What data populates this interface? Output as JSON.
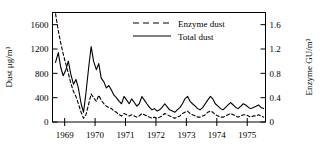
{
  "chart_data": {
    "type": "line",
    "title": "",
    "xlabel": "",
    "ylabel": "Dust μg/m³",
    "y2label": "Enzyme GU/m³",
    "xlim": [
      1968.6,
      1975.6
    ],
    "ylim": [
      0,
      1800
    ],
    "y2lim": [
      0,
      1.8
    ],
    "grid": false,
    "legend_position": "top-center",
    "xticks": [
      1969,
      1970,
      1971,
      1972,
      1973,
      1974,
      1975
    ],
    "xtick_labels": [
      "1969",
      "1970",
      "1971",
      "1972",
      "1973",
      "1974",
      "1975"
    ],
    "yticks": [
      0,
      400,
      800,
      1200,
      1600
    ],
    "ytick_labels": [
      "0",
      "400",
      "800",
      "1200",
      "1600"
    ],
    "y2ticks": [
      0,
      0.4,
      0.8,
      1.2,
      1.6
    ],
    "y2tick_labels": [
      "0",
      "0.4",
      "0.8",
      "1.2",
      "1.6"
    ],
    "series": [
      {
        "name": "Total dust",
        "style": "solid",
        "axis": "left",
        "color": "#000000",
        "x": [
          1968.7,
          1968.79,
          1968.87,
          1968.95,
          1969.04,
          1969.12,
          1969.2,
          1969.29,
          1969.37,
          1969.45,
          1969.54,
          1969.62,
          1969.7,
          1969.79,
          1969.87,
          1969.95,
          1970.04,
          1970.12,
          1970.2,
          1970.29,
          1970.37,
          1970.45,
          1970.54,
          1970.62,
          1970.7,
          1970.79,
          1970.87,
          1970.95,
          1971.04,
          1971.12,
          1971.2,
          1971.29,
          1971.37,
          1971.45,
          1971.54,
          1971.62,
          1971.7,
          1971.79,
          1971.87,
          1971.95,
          1972.04,
          1972.12,
          1972.2,
          1972.29,
          1972.37,
          1972.45,
          1972.54,
          1972.62,
          1972.7,
          1972.79,
          1972.87,
          1972.95,
          1973.04,
          1973.12,
          1973.2,
          1973.29,
          1973.37,
          1973.45,
          1973.54,
          1973.62,
          1973.7,
          1973.79,
          1973.87,
          1973.95,
          1974.04,
          1974.12,
          1974.2,
          1974.29,
          1974.37,
          1974.45,
          1974.54,
          1974.62,
          1974.7,
          1974.79,
          1974.87,
          1974.95,
          1975.04,
          1975.12,
          1975.2,
          1975.29,
          1975.37,
          1975.45,
          1975.54
        ],
        "y": [
          980,
          1140,
          900,
          760,
          860,
          1000,
          790,
          620,
          700,
          560,
          300,
          160,
          480,
          900,
          1240,
          1000,
          860,
          960,
          720,
          660,
          560,
          600,
          520,
          440,
          400,
          340,
          300,
          420,
          360,
          300,
          380,
          320,
          260,
          300,
          420,
          360,
          300,
          240,
          200,
          220,
          180,
          200,
          240,
          300,
          250,
          200,
          180,
          160,
          200,
          240,
          300,
          380,
          420,
          340,
          300,
          260,
          220,
          200,
          240,
          300,
          360,
          420,
          380,
          300,
          260,
          220,
          200,
          240,
          280,
          320,
          280,
          240,
          220,
          260,
          300,
          280,
          240,
          220,
          240,
          260,
          280,
          240,
          220
        ]
      },
      {
        "name": "Enzyme dust",
        "style": "dashed",
        "axis": "right",
        "color": "#000000",
        "x": [
          1968.7,
          1968.79,
          1968.87,
          1968.95,
          1969.04,
          1969.12,
          1969.2,
          1969.29,
          1969.37,
          1969.45,
          1969.54,
          1969.62,
          1969.7,
          1969.79,
          1969.87,
          1969.95,
          1970.04,
          1970.12,
          1970.2,
          1970.29,
          1970.37,
          1970.45,
          1970.54,
          1970.62,
          1970.7,
          1970.79,
          1970.87,
          1970.95,
          1971.04,
          1971.12,
          1971.2,
          1971.29,
          1971.37,
          1971.45,
          1971.54,
          1971.62,
          1971.7,
          1971.79,
          1971.87,
          1971.95,
          1972.04,
          1972.12,
          1972.2,
          1972.29,
          1972.37,
          1972.45,
          1972.54,
          1972.62,
          1972.7,
          1972.79,
          1972.87,
          1972.95,
          1973.04,
          1973.12,
          1973.2,
          1973.29,
          1973.37,
          1973.45,
          1973.54,
          1973.62,
          1973.7,
          1973.79,
          1973.87,
          1973.95,
          1974.04,
          1974.12,
          1974.2,
          1974.29,
          1974.37,
          1974.45,
          1974.54,
          1974.62,
          1974.7,
          1974.79,
          1974.87,
          1974.95,
          1975.04,
          1975.12,
          1975.2,
          1975.29,
          1975.37,
          1975.45,
          1975.54
        ],
        "y": [
          1.78,
          1.5,
          1.3,
          1.12,
          0.95,
          0.8,
          0.64,
          0.5,
          0.42,
          0.3,
          0.16,
          0.06,
          0.12,
          0.3,
          0.46,
          0.4,
          0.34,
          0.44,
          0.36,
          0.3,
          0.26,
          0.24,
          0.22,
          0.18,
          0.16,
          0.12,
          0.1,
          0.14,
          0.12,
          0.1,
          0.12,
          0.1,
          0.08,
          0.1,
          0.14,
          0.12,
          0.1,
          0.08,
          0.06,
          0.08,
          0.06,
          0.08,
          0.1,
          0.14,
          0.12,
          0.1,
          0.08,
          0.06,
          0.08,
          0.1,
          0.14,
          0.16,
          0.18,
          0.14,
          0.12,
          0.1,
          0.08,
          0.08,
          0.1,
          0.12,
          0.16,
          0.18,
          0.16,
          0.12,
          0.1,
          0.08,
          0.08,
          0.1,
          0.12,
          0.14,
          0.12,
          0.1,
          0.08,
          0.1,
          0.12,
          0.12,
          0.1,
          0.08,
          0.1,
          0.1,
          0.12,
          0.1,
          0.08
        ]
      }
    ]
  },
  "legend": {
    "items": [
      {
        "label": "Enzyme dust",
        "style": "dashed"
      },
      {
        "label": "Total dust",
        "style": "solid"
      }
    ]
  },
  "axes": {
    "left_title": "Dust μg/m³",
    "right_title": "Enzyme GU/m³"
  },
  "colors": {
    "line": "#000000",
    "frame": "#000000",
    "background": "#ffffff"
  }
}
